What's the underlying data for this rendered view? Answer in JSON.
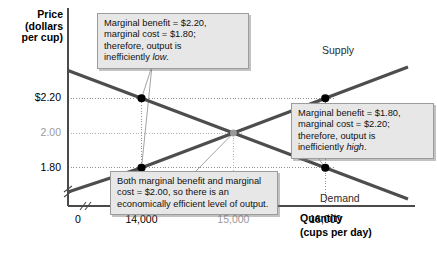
{
  "chart_data": {
    "type": "line",
    "title": "",
    "xlabel": "Quantity",
    "xlabel_unit": "(cups per day)",
    "ylabel": "Price",
    "ylabel_unit_line1": "(dollars",
    "ylabel_unit_line2": "per cup)",
    "x_ticks": [
      {
        "label": "0",
        "value": 0,
        "muted": false
      },
      {
        "label": "14,000",
        "value": 14000,
        "muted": false
      },
      {
        "label": "15,000",
        "value": 15000,
        "muted": true
      },
      {
        "label": "16,000",
        "value": 16000,
        "muted": false
      }
    ],
    "y_ticks": [
      {
        "label": "$2.20",
        "value": 2.2,
        "muted": false
      },
      {
        "label": "2.00",
        "value": 2.0,
        "muted": true
      },
      {
        "label": "1.80",
        "value": 1.8,
        "muted": false
      }
    ],
    "axis_break": true,
    "grid": "dotted-guides",
    "legend_position": "inline-curve-labels",
    "series": [
      {
        "name": "Supply",
        "label": "Supply",
        "slope": "upward",
        "color": "#4d4d4d",
        "points": [
          {
            "x": 13200,
            "y": 1.66
          },
          {
            "x": 14000,
            "y": 1.8
          },
          {
            "x": 15000,
            "y": 2.0
          },
          {
            "x": 16000,
            "y": 2.2
          },
          {
            "x": 16900,
            "y": 2.38
          }
        ]
      },
      {
        "name": "Demand",
        "label": "Demand",
        "slope": "downward",
        "color": "#4d4d4d",
        "points": [
          {
            "x": 13200,
            "y": 2.36
          },
          {
            "x": 14000,
            "y": 2.2
          },
          {
            "x": 15000,
            "y": 2.0
          },
          {
            "x": 16000,
            "y": 1.8
          },
          {
            "x": 16900,
            "y": 1.62
          }
        ]
      }
    ],
    "markers": [
      {
        "name": "demand-at-14000",
        "x": 14000,
        "y": 2.2,
        "color": "#000000",
        "curve": "Demand"
      },
      {
        "name": "supply-at-14000",
        "x": 14000,
        "y": 1.8,
        "color": "#000000",
        "curve": "Supply"
      },
      {
        "name": "equilibrium",
        "x": 15000,
        "y": 2.0,
        "color": "#9a9a9a",
        "curve": "both"
      },
      {
        "name": "supply-at-16000",
        "x": 16000,
        "y": 2.2,
        "color": "#000000",
        "curve": "Supply"
      },
      {
        "name": "demand-at-16000",
        "x": 16000,
        "y": 1.8,
        "color": "#000000",
        "curve": "Demand"
      }
    ],
    "annotations": [
      {
        "id": "inefficiently-low",
        "lines": [
          "Marginal benefit = $2.20,",
          "marginal cost = $1.80;",
          "therefore, output is",
          "inefficiently low."
        ],
        "italic_word": "low",
        "points_to": [
          "demand-at-14000",
          "supply-at-14000"
        ]
      },
      {
        "id": "inefficiently-high",
        "lines": [
          "Marginal benefit = $1.80,",
          "marginal cost = $2.20;",
          "therefore, output is",
          "inefficiently high."
        ],
        "italic_word": "high",
        "points_to": [
          "supply-at-16000",
          "demand-at-16000"
        ]
      },
      {
        "id": "economically-efficient",
        "lines": [
          "Both marginal benefit and marginal",
          "cost = $2.00, so there is an",
          "economically efficient level of output."
        ],
        "italic_word": "",
        "points_to": [
          "equilibrium"
        ]
      }
    ]
  },
  "colors": {
    "curve": "#4d4d4d",
    "axis": "#4a4a4a",
    "marker": "#000000",
    "equilibrium_marker": "#9a9a9a",
    "guide": "#8f8f8f",
    "callout_bg": "#e7e7e7",
    "callout_border": "#9c9c9c",
    "muted_text": "#9a9a9a"
  }
}
